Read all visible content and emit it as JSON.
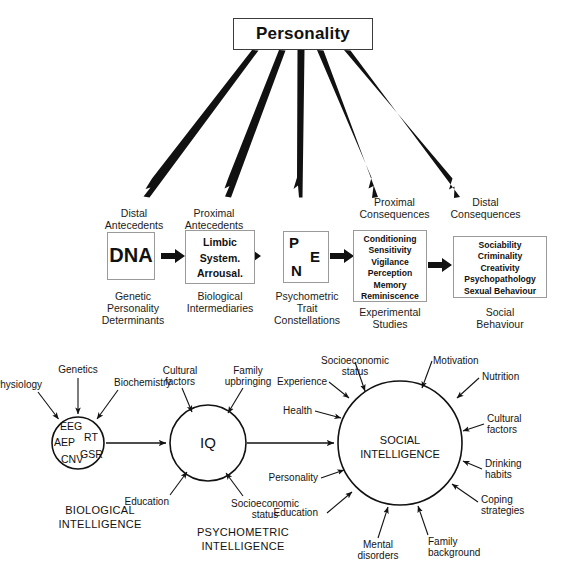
{
  "figure": {
    "title": "Personality",
    "top_node": {
      "label": "Personality"
    },
    "fan_arrow_count": 5,
    "chain": {
      "nodes": [
        {
          "id": "dna",
          "top_label": "Distal\nAntecedents",
          "body": "DNA",
          "bottom_label": "Genetic\nPersonality\nDeterminants"
        },
        {
          "id": "limbic",
          "top_label": "Proximal\nAntecedents",
          "body": "Limbic\nSystem.\nArrousal.",
          "bottom_label": "Biological\nIntermediaries"
        },
        {
          "id": "pen",
          "top_label": "",
          "body": "P E N",
          "letters": [
            "P",
            "E",
            "N"
          ],
          "bottom_label": "Psychometric\nTrait\nConstellations"
        },
        {
          "id": "proximal-consequences",
          "top_label": "Proximal\nConsequences",
          "body": "Conditioning\nSensitivity\nVigilance\nPerception\nMemory\nReminiscence",
          "bottom_label": "Experimental\nStudies"
        },
        {
          "id": "distal-consequences",
          "top_label": "Distal\nConsequences",
          "body": "Sociability\nCriminality\nCreativity\nPsychopathology\nSexual Behaviour",
          "bottom_label": "Social\nBehaviour"
        }
      ]
    },
    "intelligence": {
      "biological": {
        "core_tags": [
          "EEG",
          "AEP",
          "RT",
          "GSR",
          "CNV"
        ],
        "caption": "BIOLOGICAL\nINTELLIGENCE",
        "inputs": [
          "Physiology",
          "Genetics",
          "Biochemistry"
        ]
      },
      "psychometric": {
        "core": "IQ",
        "caption": "PSYCHOMETRIC\nINTELLIGENCE",
        "inputs": [
          "Cultural\nfactors",
          "Family\nupbringing",
          "Education",
          "Socioeconomic\nstatus"
        ]
      },
      "social": {
        "core": "SOCIAL\nINTELLIGENCE",
        "caption": "",
        "inputs": [
          "Socioeconomic\nstatus",
          "Motivation",
          "Nutrition",
          "Experience",
          "Health",
          "Cultural\nfactors",
          "Personality",
          "Drinking\nhabits",
          "Education",
          "Coping\nstrategies",
          "Mental\ndisorders",
          "Family\nbackground"
        ]
      }
    },
    "colors": {
      "ink": "#111111",
      "box_border": "#9a9a9a",
      "title_border": "#3c3c3c",
      "background": "#ffffff"
    }
  }
}
